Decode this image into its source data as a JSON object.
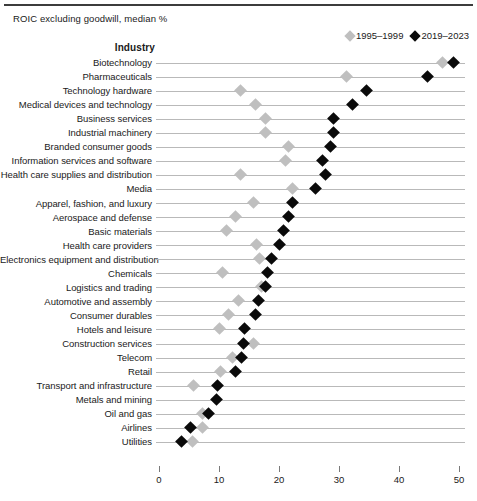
{
  "header": {
    "cut_title_sliver": "",
    "subtitle": "ROIC excluding goodwill, median %",
    "industry_column_header": "Industry"
  },
  "legend": {
    "position": "top-right",
    "entries": [
      {
        "label": "1995–1999",
        "color": "#bfbfbf",
        "marker": "diamond"
      },
      {
        "label": "2019–2023",
        "color": "#0a0a0a",
        "marker": "diamond"
      }
    ]
  },
  "axis": {
    "ticks": [
      "0",
      "10",
      "20",
      "30",
      "40",
      "50"
    ],
    "min": 0,
    "max": 50
  },
  "chart_data": {
    "type": "scatter",
    "title": "",
    "subtitle": "ROIC excluding goodwill, median %",
    "xlabel": "",
    "ylabel": "Industry",
    "xlim": [
      0,
      50
    ],
    "grid": false,
    "legend_position": "top-right",
    "orientation": "horizontal",
    "categories": [
      "Biotechnology",
      "Pharmaceuticals",
      "Technology hardware",
      "Medical devices and technology",
      "Business services",
      "Industrial machinery",
      "Branded consumer goods",
      "Information services and software",
      "Health care supplies and distribution",
      "Media",
      "Apparel, fashion, and luxury",
      "Aerospace and defense",
      "Basic materials",
      "Health care providers",
      "Electronics equipment and distribution",
      "Chemicals",
      "Logistics and trading",
      "Automotive and assembly",
      "Consumer durables",
      "Hotels and leisure",
      "Construction services",
      "Telecom",
      "Retail",
      "Transport and infrastructure",
      "Metals and mining",
      "Oil and gas",
      "Airlines",
      "Utilities"
    ],
    "series": [
      {
        "name": "1995–1999",
        "color": "#bfbfbf",
        "values": [
          47.3,
          31.3,
          13.5,
          16.0,
          17.8,
          17.7,
          21.5,
          21.0,
          13.5,
          22.2,
          15.7,
          12.7,
          11.3,
          16.2,
          16.8,
          10.5,
          17.0,
          13.3,
          11.5,
          10.0,
          15.7,
          12.3,
          10.3,
          5.8,
          null,
          7.2,
          7.2,
          5.5
        ]
      },
      {
        "name": "2019–2023",
        "color": "#0a0a0a",
        "values": [
          49.0,
          44.7,
          34.5,
          32.3,
          29.0,
          29.0,
          28.5,
          27.3,
          27.7,
          26.0,
          22.2,
          21.5,
          20.7,
          20.0,
          18.7,
          18.0,
          17.8,
          16.5,
          16.0,
          14.3,
          14.0,
          13.8,
          12.8,
          9.8,
          9.5,
          8.3,
          5.2,
          3.8
        ]
      }
    ]
  }
}
